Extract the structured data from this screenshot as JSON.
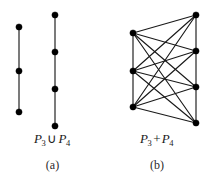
{
  "figure": {
    "width": 209,
    "height": 184,
    "background": "#ffffff",
    "ink_color": "#000000",
    "edge_color": "#1a1a1a",
    "vertex_radius": 3.1,
    "edge_width": 1.15
  },
  "panels": [
    {
      "id": "a",
      "caption": "(a)",
      "formula": {
        "left_symbol": "P",
        "left_subscript": "3",
        "operator": "∪",
        "right_symbol": "P",
        "right_subscript": "4"
      },
      "formula_plain": "P3 ∪ P4",
      "graph": {
        "name": "disjoint-union",
        "components": [
          {
            "name": "P3",
            "vertices": [
              {
                "id": "a1",
                "x": 19,
                "y": 27
              },
              {
                "id": "a2",
                "x": 19,
                "y": 71
              },
              {
                "id": "a3",
                "x": 19,
                "y": 112
              }
            ],
            "edges": [
              [
                "a1",
                "a2"
              ],
              [
                "a2",
                "a3"
              ]
            ]
          },
          {
            "name": "P4",
            "vertices": [
              {
                "id": "b1",
                "x": 55,
                "y": 15
              },
              {
                "id": "b2",
                "x": 55,
                "y": 52
              },
              {
                "id": "b3",
                "x": 55,
                "y": 89
              },
              {
                "id": "b4",
                "x": 55,
                "y": 126
              }
            ],
            "edges": [
              [
                "b1",
                "b2"
              ],
              [
                "b2",
                "b3"
              ],
              [
                "b3",
                "b4"
              ]
            ]
          }
        ]
      }
    },
    {
      "id": "b",
      "caption": "(b)",
      "formula": {
        "left_symbol": "P",
        "left_subscript": "3",
        "operator": "+",
        "right_symbol": "P",
        "right_subscript": "4"
      },
      "formula_plain": "P3 + P4",
      "graph": {
        "name": "join",
        "vertices": [
          {
            "id": "u1",
            "x": 28,
            "y": 33,
            "part": "P3"
          },
          {
            "id": "u2",
            "x": 28,
            "y": 71,
            "part": "P3"
          },
          {
            "id": "u3",
            "x": 28,
            "y": 107,
            "part": "P3"
          },
          {
            "id": "v1",
            "x": 91,
            "y": 15,
            "part": "P4"
          },
          {
            "id": "v2",
            "x": 91,
            "y": 51,
            "part": "P4"
          },
          {
            "id": "v3",
            "x": 91,
            "y": 87,
            "part": "P4"
          },
          {
            "id": "v4",
            "x": 91,
            "y": 123,
            "part": "P4"
          }
        ],
        "path_edges": [
          [
            "u1",
            "u2"
          ],
          [
            "u2",
            "u3"
          ],
          [
            "v1",
            "v2"
          ],
          [
            "v2",
            "v3"
          ],
          [
            "v3",
            "v4"
          ]
        ],
        "join_edges": [
          [
            "u1",
            "v1"
          ],
          [
            "u1",
            "v2"
          ],
          [
            "u1",
            "v3"
          ],
          [
            "u1",
            "v4"
          ],
          [
            "u2",
            "v1"
          ],
          [
            "u2",
            "v2"
          ],
          [
            "u2",
            "v3"
          ],
          [
            "u2",
            "v4"
          ],
          [
            "u3",
            "v1"
          ],
          [
            "u3",
            "v2"
          ],
          [
            "u3",
            "v3"
          ],
          [
            "u3",
            "v4"
          ]
        ]
      }
    }
  ]
}
